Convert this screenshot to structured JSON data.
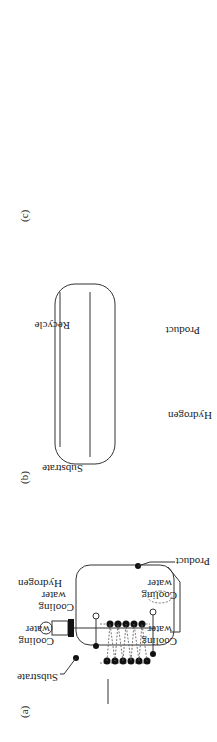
{
  "figure": {
    "panel_a": {
      "label": "(a)",
      "substrate": "Substrate",
      "cooling_water_1": [
        "Cooling",
        "water"
      ],
      "cooling_water_2": [
        "Cooling",
        "water"
      ],
      "cooling_water_3": [
        "Cooling",
        "water"
      ],
      "cooling_water_4": [
        "Cooling",
        "water"
      ],
      "hydrogen": "Hydrogen",
      "product": "Product"
    },
    "panel_b": {
      "label": "(b)",
      "substrate": "Substrate",
      "cooling_water_1": [
        "Cooling",
        "water"
      ],
      "cooling_water_2": [
        "Cooling",
        "water"
      ],
      "recycle_compressor": [
        "Recycle",
        "compressor"
      ],
      "product": "Product",
      "hydrogen": "Hydrogen"
    },
    "panel_c": {
      "label": "(c)",
      "substrate": "Substrate",
      "hydrogen": "Hydrogen",
      "cooling_water": [
        "Cooling",
        "water"
      ],
      "primary_heat_exchanger": [
        "Primary",
        "heat",
        "exchanger"
      ],
      "recirculation_pump": [
        "Recirculation",
        "pump"
      ],
      "product": "Product"
    }
  }
}
